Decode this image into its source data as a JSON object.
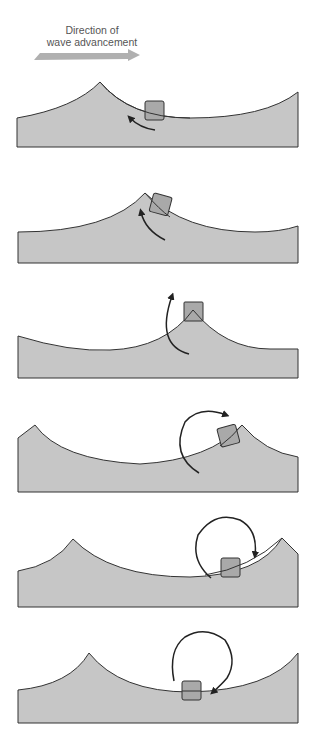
{
  "caption": {
    "line1": "Direction of",
    "line2": "wave advancement"
  },
  "colors": {
    "water_fill": "#c6c6c6",
    "water_stroke": "#333333",
    "box_fill": "#a9a9a9",
    "arrow_fill": "#a9a9a9",
    "motion_arrow": "#222222"
  },
  "panels": [
    {
      "id": 1,
      "description": "Object on back slope of wave, moving upward and backward"
    },
    {
      "id": 2,
      "description": "Object near crest, tilted"
    },
    {
      "id": 3,
      "description": "Object at crest"
    },
    {
      "id": 4,
      "description": "Object on front slope, moving forward"
    },
    {
      "id": 5,
      "description": "Object descending into trough"
    },
    {
      "id": 6,
      "description": "Object in trough, completing circular orbit"
    }
  ]
}
